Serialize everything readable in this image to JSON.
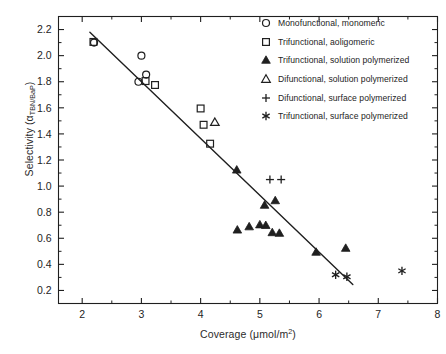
{
  "chart_data": {
    "type": "scatter",
    "title": "",
    "xlabel": "Coverage (μmol/m²)",
    "xlabel_parts": {
      "text": "Coverage (μmol/m",
      "sup": "2",
      "tail": ")"
    },
    "ylabel": "Selectivity (αTBN/BaP)",
    "ylabel_parts": {
      "text": "Selectivity (α",
      "sub": "TBN/BaP",
      "tail": ")"
    },
    "xlim": [
      1.6,
      8.0
    ],
    "ylim": [
      0.1,
      2.3
    ],
    "xticks": [
      2,
      3,
      4,
      5,
      6,
      7,
      8
    ],
    "xticklabels": [
      "2",
      "3",
      "4",
      "5",
      "6",
      "7",
      "8"
    ],
    "x_minor_step": 0.5,
    "yticks": [
      0.2,
      0.4,
      0.6,
      0.8,
      1.0,
      1.2,
      1.4,
      1.6,
      1.8,
      2.0,
      2.2
    ],
    "yticklabels": [
      "0.2",
      "0.4",
      "0.6",
      "0.8",
      "1.0",
      "1.2",
      "1.4",
      "1.6",
      "1.8",
      "2.0",
      "2.2"
    ],
    "y_minor_step": 0.1,
    "grid": false,
    "frame": "box",
    "marker_color": "#1f1f1f",
    "line_color": "#1f1f1f",
    "trendline": {
      "x": [
        2.13,
        6.57
      ],
      "y": [
        2.18,
        0.245
      ]
    },
    "legend_position": "top-right",
    "series": [
      {
        "name": "Monofunctional, monomeric",
        "marker": "circle-open",
        "points": [
          [
            2.2,
            2.1
          ],
          [
            3.0,
            2.0
          ],
          [
            2.95,
            1.8
          ],
          [
            3.08,
            1.855
          ]
        ]
      },
      {
        "name": "Trifunctional, aoligomeric",
        "marker": "square-open",
        "points": [
          [
            2.19,
            2.105
          ],
          [
            3.07,
            1.805
          ],
          [
            3.23,
            1.775
          ],
          [
            4.0,
            1.595
          ],
          [
            4.05,
            1.47
          ],
          [
            4.16,
            1.325
          ]
        ]
      },
      {
        "name": "Trifunctional, solution polymerized",
        "marker": "triangle-filled",
        "points": [
          [
            4.61,
            1.125
          ],
          [
            5.08,
            0.855
          ],
          [
            5.26,
            0.89
          ],
          [
            4.82,
            0.69
          ],
          [
            5.0,
            0.705
          ],
          [
            5.1,
            0.7
          ],
          [
            5.21,
            0.645
          ],
          [
            5.33,
            0.64
          ],
          [
            4.62,
            0.665
          ],
          [
            5.95,
            0.495
          ],
          [
            6.45,
            0.525
          ]
        ]
      },
      {
        "name": "Difunctional, solution polymerized",
        "marker": "triangle-open",
        "points": [
          [
            4.24,
            1.49
          ]
        ]
      },
      {
        "name": "Difunctional, surface polymerized",
        "marker": "plus",
        "points": [
          [
            5.17,
            1.05
          ],
          [
            5.36,
            1.05
          ]
        ]
      },
      {
        "name": "Trifunctional, surface polymerized",
        "marker": "asterisk",
        "points": [
          [
            6.28,
            0.32
          ],
          [
            6.47,
            0.305
          ],
          [
            7.4,
            0.35
          ]
        ]
      }
    ]
  },
  "legend": {
    "items": [
      {
        "label": "Monofunctional, monomeric",
        "marker": "circle-open"
      },
      {
        "label": "Trifunctional, aoligomeric",
        "marker": "square-open"
      },
      {
        "label": "Trifunctional, solution polymerized",
        "marker": "triangle-filled"
      },
      {
        "label": "Difunctional, solution polymerized",
        "marker": "triangle-open"
      },
      {
        "label": "Difunctional, surface polymerized",
        "marker": "plus"
      },
      {
        "label": "Trifunctional, surface polymerized",
        "marker": "asterisk"
      }
    ]
  }
}
